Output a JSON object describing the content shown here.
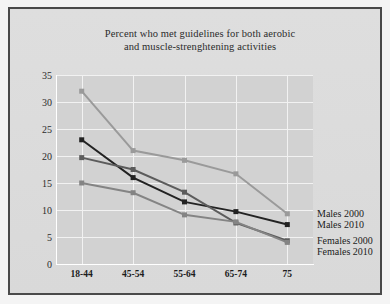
{
  "chart_data": {
    "type": "line",
    "title": "Percent who met guidelines for both aerobic and muscle-strenghtening activities",
    "title_line1": "Percent who met guidelines for both aerobic",
    "title_line2": "and muscle-strenghtening activities",
    "xlabel": "",
    "ylabel": "",
    "categories": [
      "18-44",
      "45-54",
      "55-64",
      "65-74",
      "75"
    ],
    "ylim": [
      0,
      35
    ],
    "yticks": [
      "0",
      "5",
      "10",
      "15",
      "20",
      "25",
      "30",
      "35"
    ],
    "grid": true,
    "legend_position": "right-inline",
    "series": [
      {
        "name": "Males 2000",
        "color": "#9a9a9a",
        "values": [
          32.0,
          21.0,
          19.2,
          16.7,
          9.3
        ]
      },
      {
        "name": "Males 2010",
        "color": "#222222",
        "values": [
          23.0,
          16.0,
          11.5,
          9.7,
          7.3
        ]
      },
      {
        "name": "Females 2000",
        "color": "#5c5c5c",
        "values": [
          19.7,
          17.5,
          13.3,
          7.6,
          4.3
        ]
      },
      {
        "name": "Females 2010",
        "color": "#848484",
        "values": [
          15.0,
          13.2,
          9.1,
          7.8,
          4.0
        ]
      }
    ]
  },
  "legend": {
    "items": [
      {
        "label": "Males 2000"
      },
      {
        "label": "Males 2010"
      },
      {
        "label": "Females 2000"
      },
      {
        "label": "Females 2010"
      }
    ]
  },
  "colors": {
    "page_background": "#f4f4f4",
    "panel_background": "#dcdcdc",
    "plot_background": "#d2d2d2",
    "gridline": "#f2f2f2",
    "frame_border": "#4a4a4a",
    "text": "#1c1c1c"
  }
}
